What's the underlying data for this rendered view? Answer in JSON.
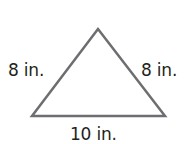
{
  "diagram": {
    "shape": "isosceles-triangle",
    "stroke_color": "#6d6e71",
    "text_color": "#231f20",
    "labels": {
      "left_side": "8 in.",
      "right_side": "8 in.",
      "base": "10 in."
    }
  }
}
